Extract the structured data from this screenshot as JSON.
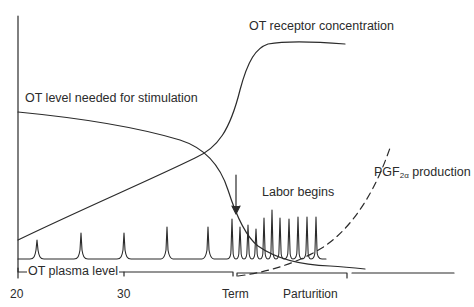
{
  "diagram": {
    "labels": {
      "receptor": "OT receptor concentration",
      "stimulation": "OT level needed for stimulation",
      "labor_begins": "Labor begins",
      "pgf_prefix": "PGF",
      "pgf_subscript": "2α",
      "pgf_suffix": " production",
      "plasma": "OT plasma level"
    },
    "x_axis": {
      "ticks": [
        "20",
        "30",
        "Term",
        "Parturition"
      ]
    },
    "colors": {
      "line": "#2b2b2b",
      "background": "#ffffff"
    },
    "curves": [
      {
        "name": "OT receptor concentration",
        "style": "solid",
        "trend": "low rising, sigmoid jump near term, plateau"
      },
      {
        "name": "OT level needed for stimulation",
        "style": "solid",
        "trend": "high, slowly declining, drops sharply near term"
      },
      {
        "name": "PGF2α production",
        "style": "dashed",
        "trend": "starts at term, rises steeply during parturition"
      },
      {
        "name": "OT plasma level",
        "style": "solid spikes",
        "trend": "pulsatile spikes, increasing frequency and amplitude toward parturition"
      }
    ]
  }
}
